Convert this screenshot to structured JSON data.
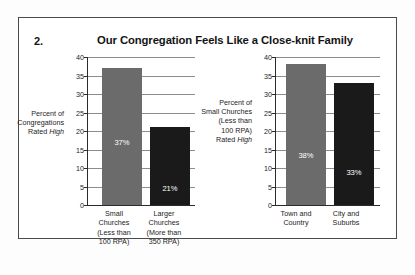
{
  "item_number": "2.",
  "title": "Our Congregation Feels Like a Close-knit Family",
  "colors": {
    "bar_gray": "#6b6b6b",
    "bar_black": "#1a1a1a",
    "gridline": "#8c8c8c",
    "axis": "#2b2b2b",
    "frame": "#4a4a4a",
    "text": "#1d1d1d",
    "value_label": "#ffffff"
  },
  "charts": [
    {
      "id": "by-church-size",
      "axis_caption_lines": [
        "Percent of",
        "Congregations",
        "Rated "
      ],
      "axis_caption_italic": "High",
      "ticks": [
        "0",
        "5",
        "10",
        "15",
        "20",
        "25",
        "30",
        "35",
        "40"
      ],
      "categories": [
        [
          "Small",
          "Churches",
          "(Less than",
          "100 RPA)"
        ],
        [
          "Larger",
          "Churches",
          "(More than",
          "350 RPA)"
        ]
      ],
      "value_labels": [
        "37%",
        "21%"
      ]
    },
    {
      "id": "by-location",
      "axis_caption_lines": [
        "Percent of",
        "Small Churches",
        "(Less than",
        "100 RPA)",
        "Rated "
      ],
      "axis_caption_italic": "High",
      "ticks": [
        "0",
        "5",
        "10",
        "15",
        "20",
        "25",
        "30",
        "35",
        "40"
      ],
      "categories": [
        [
          "Town and",
          "Country"
        ],
        [
          "City and",
          "Suburbs"
        ]
      ],
      "value_labels": [
        "38%",
        "33%"
      ]
    }
  ],
  "chart_data": [
    {
      "type": "bar",
      "id": "by-church-size",
      "title": "Our Congregation Feels Like a Close-knit Family",
      "subtitle": "",
      "xlabel": "",
      "ylabel": "Percent of Congregations Rated High",
      "categories": [
        "Small Churches (Less than 100 RPA)",
        "Larger Churches (More than 350 RPA)"
      ],
      "values": [
        37,
        21
      ],
      "data_labels": [
        "37%",
        "21%"
      ],
      "bar_colors": [
        "#6b6b6b",
        "#1a1a1a"
      ],
      "ylim": [
        0,
        40
      ],
      "ytick_step": 5,
      "yticks": [
        0,
        5,
        10,
        15,
        20,
        25,
        30,
        35,
        40
      ],
      "grid": true,
      "legend": false
    },
    {
      "type": "bar",
      "id": "by-location",
      "title": "Our Congregation Feels Like a Close-knit Family",
      "subtitle": "",
      "xlabel": "",
      "ylabel": "Percent of Small Churches (Less than 100 RPA) Rated High",
      "categories": [
        "Town and Country",
        "City and Suburbs"
      ],
      "values": [
        38,
        33
      ],
      "data_labels": [
        "38%",
        "33%"
      ],
      "bar_colors": [
        "#6b6b6b",
        "#1a1a1a"
      ],
      "ylim": [
        0,
        40
      ],
      "ytick_step": 5,
      "yticks": [
        0,
        5,
        10,
        15,
        20,
        25,
        30,
        35,
        40
      ],
      "grid": true,
      "legend": false
    }
  ]
}
